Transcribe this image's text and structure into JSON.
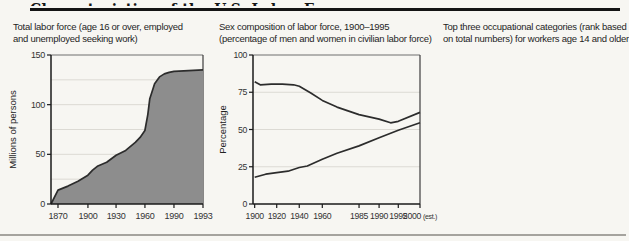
{
  "header": {
    "title": "Characteristics of the U.S. Labor Force"
  },
  "panels": {
    "total_labor_force": {
      "caption_line1": "Total labor force (age 16 or over, employed",
      "caption_line2": "and unemployed seeking work)"
    },
    "sex_composition": {
      "caption_line1": "Sex composition of labor force, 1900–1995",
      "caption_line2": "(percentage of men and women in civilian labor force)"
    },
    "occupations": {
      "caption_line1": "Top three occupational categories (rank based",
      "caption_line2": "on total numbers) for workers age 14 and older"
    }
  },
  "colors": {
    "area_fill": "#8d8d8d",
    "line_stroke": "#2c2c2c",
    "axis": "#1a1a1a",
    "grid": "#dcdad4",
    "frame": "#6e6e6e"
  },
  "chart_data": [
    {
      "id": "total-labor-force-chart",
      "type": "area",
      "title": "Total labor force (age 16 or over, employed and unemployed seeking work)",
      "xlabel": "",
      "ylabel": "Millions of persons",
      "ylim": [
        0,
        150
      ],
      "yticks": [
        0,
        50,
        100,
        150
      ],
      "grid_values": [
        25,
        50,
        75,
        100,
        125
      ],
      "xticks": [
        {
          "label": "1870",
          "year": 1870,
          "frac": 0.046
        },
        {
          "label": "1900",
          "year": 1900,
          "frac": 0.243
        },
        {
          "label": "1930",
          "year": 1930,
          "frac": 0.428
        },
        {
          "label": "1960",
          "year": 1960,
          "frac": 0.618
        },
        {
          "label": "1990",
          "year": 1990,
          "frac": 0.809
        },
        {
          "label": "1993",
          "year": 1993,
          "frac": 1.0
        }
      ],
      "points": [
        [
          1870,
          14
        ],
        [
          1880,
          18
        ],
        [
          1890,
          23
        ],
        [
          1900,
          29
        ],
        [
          1905,
          34
        ],
        [
          1910,
          38
        ],
        [
          1920,
          42
        ],
        [
          1930,
          49
        ],
        [
          1940,
          54
        ],
        [
          1950,
          62
        ],
        [
          1955,
          67
        ],
        [
          1960,
          74
        ],
        [
          1963,
          90
        ],
        [
          1965,
          106
        ],
        [
          1970,
          121
        ],
        [
          1975,
          128
        ],
        [
          1980,
          131
        ],
        [
          1985,
          132.5
        ],
        [
          1990,
          133.5
        ],
        [
          1993,
          135
        ]
      ]
    },
    {
      "id": "sex-composition-chart",
      "type": "line",
      "title": "Sex composition of labor force, 1900–1995 (percentage of men and women in civilian labor force)",
      "xlabel": "",
      "ylabel": "Percentage",
      "ylim": [
        0,
        100
      ],
      "yticks": [
        0,
        25,
        50,
        75,
        100
      ],
      "grid_values": [
        25,
        50,
        75
      ],
      "xticks": [
        {
          "label": "1900",
          "year": 1900,
          "frac": 0.01
        },
        {
          "label": "1920",
          "year": 1920,
          "frac": 0.142
        },
        {
          "label": "1940",
          "year": 1940,
          "frac": 0.277
        },
        {
          "label": "1960",
          "year": 1960,
          "frac": 0.415
        },
        {
          "label": "1985",
          "year": 1985,
          "frac": 0.635
        },
        {
          "label": "1990",
          "year": 1990,
          "frac": 0.755
        },
        {
          "label": "1995",
          "year": 1995,
          "frac": 0.87
        },
        {
          "label": "2000",
          "year": 2000,
          "frac": 1.0,
          "suffix": "(est.)"
        }
      ],
      "series": [
        {
          "name": "men",
          "points": [
            [
              1900,
              82
            ],
            [
              1905,
              80
            ],
            [
              1915,
              80.5
            ],
            [
              1925,
              80.5
            ],
            [
              1935,
              80
            ],
            [
              1940,
              79
            ],
            [
              1950,
              74.5
            ],
            [
              1960,
              69.5
            ],
            [
              1970,
              65
            ],
            [
              1985,
              60
            ],
            [
              1990,
              57
            ],
            [
              1993,
              54.5
            ],
            [
              1995,
              55.5
            ],
            [
              2000,
              61.5
            ]
          ]
        },
        {
          "name": "women",
          "points": [
            [
              1900,
              18
            ],
            [
              1910,
              20
            ],
            [
              1920,
              21
            ],
            [
              1930,
              22
            ],
            [
              1940,
              24.5
            ],
            [
              1947,
              25.5
            ],
            [
              1960,
              30
            ],
            [
              1970,
              34
            ],
            [
              1985,
              39
            ],
            [
              1990,
              44.5
            ],
            [
              1995,
              49.5
            ],
            [
              2000,
              54.5
            ]
          ]
        }
      ]
    },
    {
      "id": "occupations-table",
      "type": "table",
      "title": "Top three occupational categories (rank based on total numbers) for workers age 14 and older",
      "legend": [
        {
          "id": "farm",
          "label": "farm"
        },
        {
          "id": "manual",
          "label": "manual*"
        },
        {
          "id": "white_collar",
          "label": "white collar†"
        },
        {
          "id": "service",
          "label": "service"
        }
      ],
      "icons": {
        "farm": "tractor-icon",
        "manual": "crossed-tools-icon",
        "white_collar": "telephone-icon",
        "service": "chef-hat-icon"
      },
      "rank_header": {
        "label": "rank",
        "ranks": [
          "1",
          "2",
          "3"
        ]
      },
      "rows": [
        {
          "year": "1900",
          "ranks": [
            "farm",
            "manual",
            "white_collar"
          ]
        },
        {
          "year": "1920",
          "ranks": [
            "manual",
            "farm",
            "white_collar"
          ]
        },
        {
          "year": "1940",
          "ranks": [
            "manual",
            "white_collar",
            "farm"
          ]
        },
        {
          "year": "1960",
          "ranks": [
            "white_collar",
            "manual",
            "service"
          ]
        },
        {
          "year": "1990",
          "ranks": [
            "white_collar",
            "manual",
            "service"
          ]
        }
      ]
    }
  ]
}
